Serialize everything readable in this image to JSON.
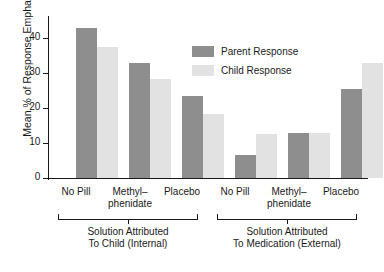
{
  "chart_data": {
    "type": "bar",
    "title": "",
    "xlabel": "",
    "ylabel": "Mean % of Response Emphasis",
    "ylim": [
      0,
      45
    ],
    "yticks": [
      0,
      10,
      20,
      30,
      40
    ],
    "ytick_labels": [
      "0",
      "10",
      "20",
      "30",
      "40"
    ],
    "grid": false,
    "legend_position": "upper right",
    "categories": [
      "No Pill",
      "Methyl–\nphenidate",
      "Placebo",
      "No Pill",
      "Methyl–\nphenidate",
      "Placebo"
    ],
    "groups": [
      {
        "label": "Solution Attributed\nTo Child (Internal)",
        "categories": [
          "No Pill",
          "Methyl–\nphenidate",
          "Placebo"
        ]
      },
      {
        "label": "Solution Attributed\nTo Medication (External)",
        "categories": [
          "No Pill",
          "Methyl–\nphenidate",
          "Placebo"
        ]
      }
    ],
    "series": [
      {
        "name": "Parent Response",
        "color": "#8e8e8e",
        "values": [
          43,
          32.8,
          23.3,
          6.7,
          12.8,
          25.5
        ]
      },
      {
        "name": "Child Response",
        "color": "#e2e2e2",
        "values": [
          37.3,
          28.2,
          18.3,
          12.5,
          13,
          33
        ]
      }
    ]
  },
  "legend": {
    "items": [
      {
        "label": "Parent Response",
        "color": "#8e8e8e"
      },
      {
        "label": "Child Response",
        "color": "#e2e2e2"
      }
    ]
  },
  "axes": {
    "y_axis_title": "Mean % of Response Emphasis",
    "y_tick_0": "0",
    "y_tick_1": "10",
    "y_tick_2": "20",
    "y_tick_3": "30",
    "y_tick_4": "40"
  },
  "category_labels": {
    "g1c1": "No Pill",
    "g1c2": "Methyl–\nphenidate",
    "g1c3": "Placebo",
    "g2c1": "No Pill",
    "g2c2": "Methyl–\nphenidate",
    "g2c3": "Placebo"
  },
  "group_labels": {
    "group1": "Solution Attributed\nTo Child (Internal)",
    "group2": "Solution Attributed\nTo Medication (External)"
  },
  "colors": {
    "parent": "#8e8e8e",
    "child": "#e2e2e2",
    "axis": "#1a1a1a"
  }
}
